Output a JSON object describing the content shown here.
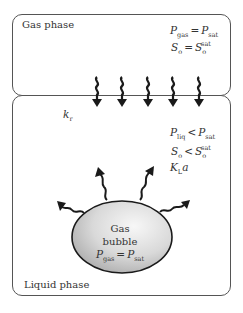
{
  "gas_phase": {
    "label": "Gas phase",
    "eq1": {
      "lhs": "P",
      "lhs_sub": "gas",
      "op": "=",
      "rhs": "P",
      "rhs_sub": "sat"
    },
    "eq2": {
      "lhs": "S",
      "lhs_sub": "o",
      "op": "=",
      "rhs": "S",
      "rhs_sub": "o",
      "rhs_sup": "sat"
    }
  },
  "interface": {
    "arrow_count": 5,
    "rate_label": "k",
    "rate_sub": "r"
  },
  "liquid_phase": {
    "label": "Liquid phase",
    "eq1": {
      "lhs": "P",
      "lhs_sub": "liq",
      "op": "<",
      "rhs": "P",
      "rhs_sub": "sat"
    },
    "eq2": {
      "lhs": "S",
      "lhs_sub": "o",
      "op": "<",
      "rhs": "S",
      "rhs_sub": "o",
      "rhs_sup": "sat"
    },
    "coef": {
      "main": "K",
      "sub": "L",
      "tail": "a"
    }
  },
  "bubble": {
    "line1": "Gas",
    "line2": "bubble",
    "eq": {
      "lhs": "P",
      "lhs_sub": "gas",
      "op": "=",
      "rhs": "P",
      "rhs_sub": "sat"
    },
    "arrow_count": 4
  },
  "colors": {
    "border": "#555555",
    "arrow": "#1a1a1a",
    "bubble_fill_light": "#f2f2f2",
    "bubble_fill_dark": "#b5b5b5"
  }
}
